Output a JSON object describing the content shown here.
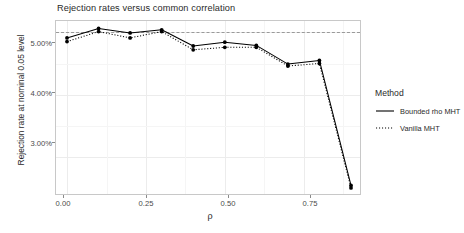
{
  "chart_data": {
    "type": "line",
    "title": "Rejection rates versus common correlation",
    "xlabel": "ρ",
    "ylabel": "Rejection rate at nominal 0.05 level",
    "x": [
      0.0,
      0.1,
      0.2,
      0.3,
      0.4,
      0.5,
      0.6,
      0.7,
      0.8,
      0.9
    ],
    "series": [
      {
        "name": "Bounded rho MHT",
        "style": "solid",
        "color": "#000000",
        "values": [
          4.91,
          5.06,
          4.99,
          5.04,
          4.78,
          4.84,
          4.79,
          4.49,
          4.55,
          2.55
        ]
      },
      {
        "name": "Vanilla MHT",
        "style": "dotted",
        "color": "#000000",
        "values": [
          4.85,
          5.01,
          4.91,
          5.01,
          4.72,
          4.76,
          4.76,
          4.46,
          4.5,
          2.51
        ]
      }
    ],
    "reference_line": {
      "y": 5.0,
      "style": "dashed",
      "color": "#9a9a9a"
    },
    "xlim": [
      -0.035,
      0.935
    ],
    "ylim": [
      2.38,
      5.18
    ],
    "xticks": [
      0.0,
      0.25,
      0.5,
      0.75
    ],
    "xtick_labels": [
      "0.00",
      "0.25",
      "0.50",
      "0.75"
    ],
    "yticks": [
      3.0,
      4.0,
      5.0
    ],
    "ytick_labels": [
      "3.00%",
      "4.00%",
      "5.00%"
    ],
    "grid": true,
    "legend_position": "right"
  },
  "legend": {
    "title": "Method",
    "entries": [
      {
        "label": "Bounded rho MHT",
        "style": "solid"
      },
      {
        "label": "Vanilla MHT",
        "style": "dotted"
      }
    ]
  }
}
